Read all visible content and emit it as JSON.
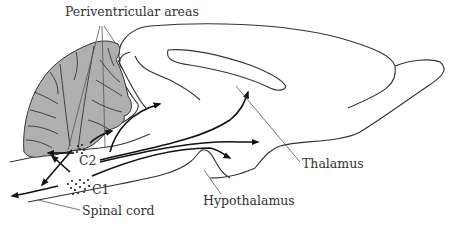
{
  "figure": {
    "labels": {
      "periventricular": "Periventricular areas",
      "thalamus": "Thalamus",
      "hypothalamus": "Hypothalamus",
      "c2": "C2",
      "c1": "C1",
      "spinal_cord": "Spinal cord"
    },
    "colors": {
      "background": "#ffffff",
      "cerebellum_fill": "#b0b0b0",
      "outline": "#333333",
      "arrows": "#111111",
      "leader_lines": "#555555",
      "text": "#333333"
    }
  }
}
